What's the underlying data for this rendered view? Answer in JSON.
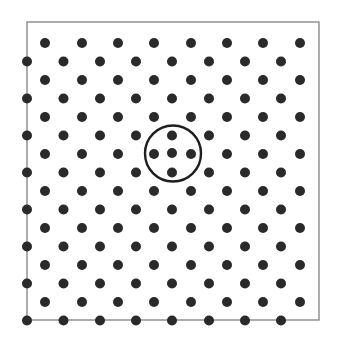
{
  "diagram": {
    "colors": {
      "background": "#ffffff",
      "border": "#8a8a8a",
      "atom": "#2a2a2a",
      "highlight_ring": "#1e1e1e"
    },
    "frame": {
      "x": 27,
      "y": 22,
      "width": 292,
      "height": 298
    },
    "lattice": {
      "rows": 16,
      "row_start_y": 43,
      "row_spacing": 18.5,
      "odd_row_x": [
        45,
        82,
        118,
        154,
        191,
        227,
        263,
        300
      ],
      "even_row_x": [
        27,
        63.5,
        100,
        136,
        172,
        209,
        245,
        281
      ],
      "atom_radius": 5
    },
    "defect": {
      "type": "interstitial-atom",
      "atom": {
        "x": 172,
        "y": 153
      },
      "ring": {
        "cx": 173,
        "cy": 153.5,
        "r": 28
      }
    }
  }
}
